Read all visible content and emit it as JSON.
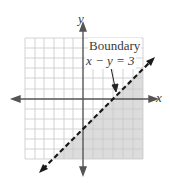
{
  "diagram": {
    "type": "inequality-graph",
    "axes": {
      "x_label": "x",
      "y_label": "y",
      "x_range": [
        -6,
        6
      ],
      "y_range": [
        -6,
        6
      ]
    },
    "boundary": {
      "title": "Boundary",
      "equation": "x − y = 3",
      "style": "dashed",
      "x_intercept": 3,
      "y_intercept": -3
    },
    "shaded_region": "below-right of boundary (x − y > 3)",
    "colors": {
      "grid": "#c8c8c8",
      "axis": "#555555",
      "shade": "#dcdcdc",
      "boundary": "#1a1a1a"
    }
  }
}
